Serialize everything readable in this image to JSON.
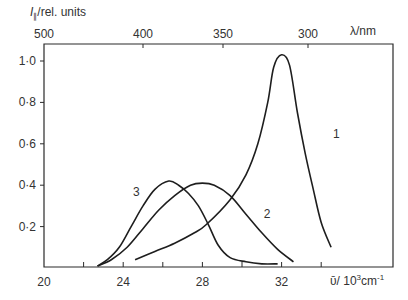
{
  "chart_data": {
    "type": "line",
    "title": "",
    "ylabel": "I∥/rel. units",
    "xlabel": "ν̄ / 10³cm⁻¹",
    "top_xlabel": "λ/nm",
    "xlim": [
      20,
      37
    ],
    "ylim": [
      0,
      1.1
    ],
    "x_ticks": [
      20,
      22,
      24,
      26,
      28,
      30,
      32,
      34
    ],
    "x_tick_labels": [
      "20",
      "",
      "24",
      "",
      "28",
      "",
      "32",
      ""
    ],
    "y_ticks": [
      0.2,
      0.4,
      0.6,
      0.8,
      1.0
    ],
    "y_tick_labels": [
      "0·2",
      "0·4",
      "0·6",
      "0·8",
      "1·0"
    ],
    "top_x_ticks_nm": [
      500,
      400,
      350,
      300
    ],
    "top_x_tick_labels": [
      "500",
      "400",
      "350",
      "300"
    ],
    "grid": false,
    "legend": "inline curve labels",
    "series": [
      {
        "name": "1",
        "label_pos": {
          "x": 34.6,
          "y": 0.63
        },
        "points": [
          [
            24.6,
            0.04
          ],
          [
            25.6,
            0.08
          ],
          [
            26.6,
            0.12
          ],
          [
            27.6,
            0.17
          ],
          [
            28.2,
            0.21
          ],
          [
            29.4,
            0.33
          ],
          [
            30.2,
            0.45
          ],
          [
            30.8,
            0.6
          ],
          [
            31.3,
            0.8
          ],
          [
            31.6,
            0.97
          ],
          [
            32.0,
            1.03
          ],
          [
            32.4,
            0.98
          ],
          [
            32.8,
            0.75
          ],
          [
            33.2,
            0.55
          ],
          [
            33.6,
            0.38
          ],
          [
            34.0,
            0.22
          ],
          [
            34.5,
            0.1
          ]
        ]
      },
      {
        "name": "2",
        "label_pos": {
          "x": 31.1,
          "y": 0.24
        },
        "points": [
          [
            22.7,
            0.01
          ],
          [
            23.4,
            0.04
          ],
          [
            24.2,
            0.1
          ],
          [
            25.0,
            0.19
          ],
          [
            25.8,
            0.28
          ],
          [
            26.6,
            0.35
          ],
          [
            27.4,
            0.4
          ],
          [
            28.0,
            0.41
          ],
          [
            28.6,
            0.4
          ],
          [
            29.4,
            0.35
          ],
          [
            30.2,
            0.26
          ],
          [
            31.0,
            0.17
          ],
          [
            31.8,
            0.09
          ],
          [
            32.6,
            0.03
          ]
        ]
      },
      {
        "name": "3",
        "label_pos": {
          "x": 24.5,
          "y": 0.35
        },
        "points": [
          [
            22.7,
            0.01
          ],
          [
            23.2,
            0.04
          ],
          [
            23.8,
            0.1
          ],
          [
            24.4,
            0.2
          ],
          [
            25.0,
            0.3
          ],
          [
            25.6,
            0.38
          ],
          [
            26.3,
            0.42
          ],
          [
            26.8,
            0.4
          ],
          [
            27.3,
            0.36
          ],
          [
            27.8,
            0.3
          ],
          [
            28.3,
            0.21
          ],
          [
            28.8,
            0.11
          ],
          [
            29.4,
            0.05
          ],
          [
            30.2,
            0.03
          ],
          [
            31.0,
            0.02
          ],
          [
            31.8,
            0.02
          ]
        ]
      }
    ]
  },
  "labels": {
    "ylabel_main": "I",
    "ylabel_sub": "∥",
    "ylabel_rest": "/rel. units",
    "top_unit": "λ/nm",
    "bottom_unit_sym": "ῡ",
    "bottom_unit_rest": "/ 10",
    "bottom_unit_exp": "3",
    "bottom_unit_cm": "cm",
    "bottom_unit_exp2": "-1"
  }
}
